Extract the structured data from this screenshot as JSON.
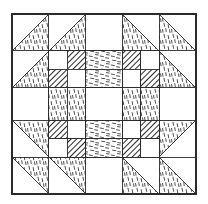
{
  "figure": {
    "kind": "quilt-block-diagram",
    "canvas": {
      "width": 208,
      "height": 204,
      "background": "#ffffff"
    },
    "block": {
      "x": 12,
      "y": 14,
      "width": 184,
      "height": 180,
      "grid_units": 10
    },
    "line_color": "#2b2b2b",
    "line_width": 0.9,
    "fills": {
      "plain": "#ffffff",
      "vertical_dash": "vertical-dash-texture",
      "horizontal_dash": "horizontal-dash-texture",
      "diagonal_hatch": "diagonal-hatch-texture"
    },
    "legend": [
      {
        "name": "plain",
        "label": "Plain / background",
        "color": "#ffffff"
      },
      {
        "name": "vertical-dash",
        "label": "Vertical dash print",
        "color": "#ffffff"
      },
      {
        "name": "horizontal-dash",
        "label": "Horizontal dash print",
        "color": "#ffffff"
      },
      {
        "name": "diagonal-hatch",
        "label": "Diagonal hatch solid",
        "color": "#8a8a8a"
      }
    ]
  },
  "geometry": {
    "cell": 18.4,
    "corner_triangles": [
      {
        "name": "tl-outer-top",
        "unit": [
          0,
          0,
          2,
          2
        ],
        "orientation": "upper-right",
        "fill": "vertical_dash"
      },
      {
        "name": "tl-inner-top",
        "unit": [
          2,
          0,
          2,
          2
        ],
        "orientation": "upper-right",
        "fill": "vertical_dash"
      },
      {
        "name": "tl-outer-left",
        "unit": [
          0,
          2,
          2,
          2
        ],
        "orientation": "upper-right",
        "fill": "vertical_dash"
      },
      {
        "name": "tr-inner-top",
        "unit": [
          6,
          0,
          2,
          2
        ],
        "orientation": "lower-left",
        "fill": "vertical_dash"
      },
      {
        "name": "tr-outer-top",
        "unit": [
          8,
          0,
          2,
          2
        ],
        "orientation": "lower-left",
        "fill": "vertical_dash"
      },
      {
        "name": "tr-outer-right",
        "unit": [
          8,
          2,
          2,
          2
        ],
        "orientation": "lower-left",
        "fill": "vertical_dash"
      },
      {
        "name": "bl-outer-left",
        "unit": [
          0,
          6,
          2,
          2
        ],
        "orientation": "lower-right",
        "fill": "vertical_dash"
      },
      {
        "name": "bl-outer-bottom",
        "unit": [
          0,
          8,
          2,
          2
        ],
        "orientation": "lower-right",
        "fill": "vertical_dash"
      },
      {
        "name": "bl-inner-bottom",
        "unit": [
          2,
          8,
          2,
          2
        ],
        "orientation": "lower-right",
        "fill": "vertical_dash"
      },
      {
        "name": "br-outer-right",
        "unit": [
          8,
          6,
          2,
          2
        ],
        "orientation": "upper-left",
        "fill": "vertical_dash"
      },
      {
        "name": "br-inner-bottom",
        "unit": [
          6,
          8,
          2,
          2
        ],
        "orientation": "upper-left",
        "fill": "vertical_dash"
      },
      {
        "name": "br-outer-bottom",
        "unit": [
          8,
          8,
          2,
          2
        ],
        "orientation": "upper-left",
        "fill": "vertical_dash"
      }
    ],
    "nine_patches": [
      {
        "name": "nine-patch-top-left",
        "unit": [
          2,
          2,
          3,
          3
        ]
      },
      {
        "name": "nine-patch-top-right",
        "unit": [
          5,
          2,
          3,
          3
        ]
      },
      {
        "name": "nine-patch-bottom-left",
        "unit": [
          2,
          5,
          3,
          3
        ]
      },
      {
        "name": "nine-patch-bottom-right",
        "unit": [
          5,
          5,
          3,
          3
        ]
      }
    ],
    "nine_patch_cells": [
      [
        "plain",
        "diagonal_hatch",
        "plain"
      ],
      [
        "diagonal_hatch",
        "plain",
        "diagonal_hatch"
      ],
      [
        "plain",
        "diagonal_hatch",
        "plain"
      ]
    ],
    "sashing": [
      {
        "name": "sash-top",
        "unit": [
          4,
          2,
          2,
          1
        ],
        "fill": "horizontal_dash"
      },
      {
        "name": "sash-top-inner",
        "unit": [
          4,
          3,
          2,
          1
        ],
        "fill": "horizontal_dash"
      },
      {
        "name": "sash-bottom-inner",
        "unit": [
          4,
          6,
          2,
          1
        ],
        "fill": "horizontal_dash"
      },
      {
        "name": "sash-bottom",
        "unit": [
          4,
          7,
          2,
          1
        ],
        "fill": "horizontal_dash"
      },
      {
        "name": "sash-left",
        "unit": [
          2,
          4,
          1,
          2
        ],
        "fill": "vertical_dash"
      },
      {
        "name": "sash-left-inner",
        "unit": [
          3,
          4,
          1,
          2
        ],
        "fill": "vertical_dash"
      },
      {
        "name": "sash-right-inner",
        "unit": [
          6,
          4,
          1,
          2
        ],
        "fill": "vertical_dash"
      },
      {
        "name": "sash-right",
        "unit": [
          7,
          4,
          1,
          2
        ],
        "fill": "vertical_dash"
      }
    ],
    "center": {
      "name": "center-square",
      "unit": [
        4,
        4,
        2,
        2
      ],
      "fill": "plain"
    },
    "edge_plain": [
      {
        "name": "edge-top-center",
        "unit": [
          4,
          0,
          2,
          2
        ],
        "fill": "plain"
      },
      {
        "name": "edge-bottom-center",
        "unit": [
          4,
          8,
          2,
          2
        ],
        "fill": "plain"
      },
      {
        "name": "edge-left-center",
        "unit": [
          0,
          4,
          2,
          2
        ],
        "fill": "plain"
      },
      {
        "name": "edge-right-center",
        "unit": [
          8,
          4,
          2,
          2
        ],
        "fill": "plain"
      }
    ]
  }
}
